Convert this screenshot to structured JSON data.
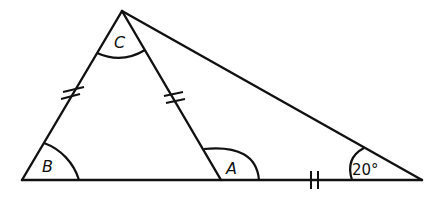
{
  "diagram": {
    "type": "geometry-triangles",
    "colors": {
      "stroke": "#111111",
      "background": "#ffffff"
    },
    "vertices": {
      "C": {
        "x": 122,
        "y": 11
      },
      "B": {
        "x": 22,
        "y": 180
      },
      "A": {
        "x": 221,
        "y": 180
      },
      "D": {
        "x": 422,
        "y": 180
      }
    },
    "angle_labels": {
      "C": "C",
      "B": "B",
      "A": "A",
      "D": "20°"
    },
    "equal_marks": [
      {
        "segment": "BC",
        "marks": 2
      },
      {
        "segment": "CA",
        "marks": 2
      },
      {
        "segment": "AD",
        "marks": 2
      }
    ]
  }
}
